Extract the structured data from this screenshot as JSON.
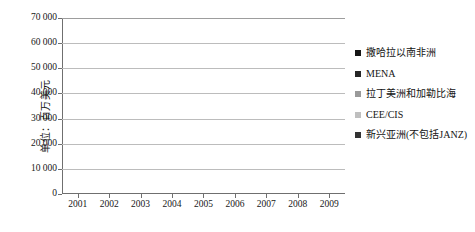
{
  "chart_data": {
    "type": "bar",
    "subtype": "stacked-vertical",
    "title": "",
    "xlabel": "",
    "ylabel": "单位：百万美元",
    "ylim": [
      0,
      70000
    ],
    "ytick_labels": [
      "70 000",
      "60 000",
      "50 000",
      "40 000",
      "30 000",
      "20 000",
      "10 000",
      "0"
    ],
    "ytick_values": [
      70000,
      60000,
      50000,
      40000,
      30000,
      20000,
      10000,
      0
    ],
    "grid": true,
    "legend_position": "right",
    "categories": [
      "2001",
      "2002",
      "2003",
      "2004",
      "2005",
      "2006",
      "2007",
      "2008",
      "2009"
    ],
    "stack_order_bottom_to_top": [
      "新兴亚洲(不包括JANZ)",
      "CEE/CIS",
      "拉丁美洲和加勒比海",
      "MENA",
      "撒哈拉以南非洲"
    ],
    "series": [
      {
        "name": "新兴亚洲(不包括JANZ)",
        "color": "#262626",
        "values": [
          6200,
          1600,
          2200,
          3200,
          15400,
          19000,
          28500,
          39800,
          15300
        ]
      },
      {
        "name": "CEE/CIS",
        "color": "#bfbfbf",
        "values": [
          400,
          500,
          500,
          1400,
          1800,
          2700,
          11700,
          2000,
          1700
        ]
      },
      {
        "name": "拉丁美洲和加勒比海",
        "color": "#9a9a9a",
        "values": [
          400,
          500,
          500,
          700,
          1700,
          1700,
          4300,
          5500,
          1100
        ]
      },
      {
        "name": "MENA",
        "color": "#4a4a4a",
        "values": [
          400,
          400,
          300,
          500,
          1600,
          1400,
          2800,
          5200,
          1200
        ]
      },
      {
        "name": "撒哈拉以南非洲",
        "color": "#161616",
        "values": [
          400,
          400,
          300,
          400,
          1500,
          2200,
          2700,
          5500,
          1700
        ]
      }
    ],
    "totals": [
      7800,
      3400,
      3800,
      6200,
      22000,
      27000,
      50000,
      58000,
      21000
    ]
  },
  "legend": {
    "items": [
      {
        "label": "撒哈拉以南非洲",
        "color": "#161616"
      },
      {
        "label": "MENA",
        "color": "#262626"
      },
      {
        "label": "拉丁美洲和加勒比海",
        "color": "#9a9a9a"
      },
      {
        "label": "CEE/CIS",
        "color": "#bfbfbf"
      },
      {
        "label": "新兴亚洲(不包括JANZ)",
        "color": "#333333"
      }
    ]
  }
}
